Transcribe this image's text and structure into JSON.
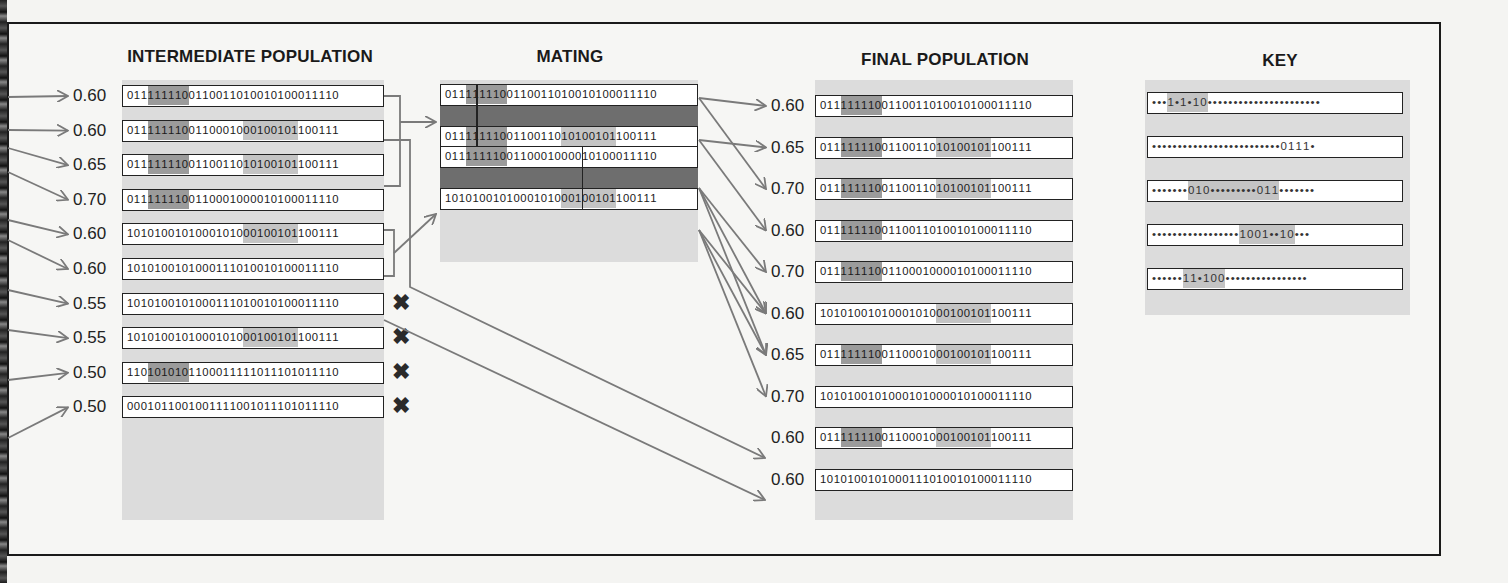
{
  "titles": {
    "intermediate": "INTERMEDIATE POPULATION",
    "mating": "MATING",
    "final": "FINAL POPULATION",
    "key": "KEY"
  },
  "colors": {
    "highlight_dark": "#9b9b9b",
    "highlight_light": "#c4c4c4",
    "arrow": "#7a7a7a",
    "band": "#dcdcdc"
  },
  "intermediate": [
    {
      "fitness": "0.60",
      "bits": "0111111100110011010010100011110",
      "shade": [
        [
          3,
          9,
          "dark"
        ]
      ],
      "culled": false
    },
    {
      "fitness": "0.60",
      "bits": "0111111100110001000100101100111",
      "shade": [
        [
          3,
          9,
          "dark"
        ],
        [
          17,
          25,
          "light"
        ]
      ],
      "culled": false
    },
    {
      "fitness": "0.65",
      "bits": "0111111100110011010100101100111",
      "shade": [
        [
          3,
          9,
          "dark"
        ],
        [
          17,
          25,
          "light"
        ]
      ],
      "culled": false
    },
    {
      "fitness": "0.70",
      "bits": "0111111100110001000010100011110",
      "shade": [
        [
          3,
          9,
          "dark"
        ]
      ],
      "culled": false
    },
    {
      "fitness": "0.60",
      "bits": "1010100101000101000100101100111",
      "shade": [
        [
          17,
          25,
          "light"
        ]
      ],
      "culled": false
    },
    {
      "fitness": "0.60",
      "bits": "1010100101000111010010100011110",
      "shade": [],
      "culled": false
    },
    {
      "fitness": "0.55",
      "bits": "1010100101000111010010100011110",
      "shade": [],
      "culled": true
    },
    {
      "fitness": "0.55",
      "bits": "1010100101000101000100101100111",
      "shade": [
        [
          17,
          25,
          "light"
        ]
      ],
      "culled": true
    },
    {
      "fitness": "0.50",
      "bits": "1101010101100011111011101011110",
      "shade": [
        [
          3,
          9,
          "dark"
        ]
      ],
      "culled": true
    },
    {
      "fitness": "0.50",
      "bits": "0001011001001111001011101011110",
      "shade": [],
      "culled": true
    }
  ],
  "mating": [
    {
      "cut_after": 4,
      "parents": [
        {
          "bits": "0111111100110011010010100011110",
          "shade": [
            [
              3,
              9,
              "dark"
            ]
          ]
        },
        {
          "bits": "0111111100110011010100101100111",
          "shade": [
            [
              3,
              9,
              "dark"
            ],
            [
              17,
              25,
              "light"
            ]
          ]
        }
      ]
    },
    {
      "cut_after": 17,
      "parents": [
        {
          "bits": "0111111100110001000010100011110",
          "shade": [
            [
              3,
              9,
              "dark"
            ]
          ]
        },
        {
          "bits": "1010100101000101000100101100111",
          "shade": [
            [
              17,
              25,
              "light"
            ]
          ]
        }
      ]
    }
  ],
  "final": [
    {
      "fitness": "0.60",
      "bits": "0111111100110011010010100011110",
      "shade": [
        [
          3,
          9,
          "dark"
        ]
      ]
    },
    {
      "fitness": "0.65",
      "bits": "0111111100110011010100101100111",
      "shade": [
        [
          3,
          9,
          "dark"
        ],
        [
          17,
          25,
          "light"
        ]
      ]
    },
    {
      "fitness": "0.70",
      "bits": "0111111100110011010100101100111",
      "shade": [
        [
          3,
          9,
          "dark"
        ],
        [
          17,
          25,
          "light"
        ]
      ]
    },
    {
      "fitness": "0.60",
      "bits": "0111111100110011010010100011110",
      "shade": [
        [
          3,
          9,
          "dark"
        ]
      ]
    },
    {
      "fitness": "0.70",
      "bits": "0111111100110001000010100011110",
      "shade": [
        [
          3,
          9,
          "dark"
        ]
      ]
    },
    {
      "fitness": "0.60",
      "bits": "1010100101000101000100101100111",
      "shade": [
        [
          17,
          25,
          "light"
        ]
      ]
    },
    {
      "fitness": "0.65",
      "bits": "0111111100110001000100101100111",
      "shade": [
        [
          3,
          9,
          "dark"
        ],
        [
          17,
          25,
          "light"
        ]
      ]
    },
    {
      "fitness": "0.70",
      "bits": "1010100101000101000010100011110",
      "shade": []
    },
    {
      "fitness": "0.60",
      "bits": "0111111100110001000100101100111",
      "shade": [
        [
          3,
          9,
          "dark"
        ],
        [
          17,
          25,
          "light"
        ]
      ]
    },
    {
      "fitness": "0.60",
      "bits": "1010100101000111010010100011110",
      "shade": []
    }
  ],
  "key": [
    {
      "pattern": "***1*1*10**********************",
      "shade": [
        [
          3,
          9,
          "light"
        ]
      ]
    },
    {
      "pattern": "*************************0111*",
      "shade": []
    },
    {
      "pattern": "*******010*********011*******",
      "shade": [
        [
          7,
          22,
          "light"
        ]
      ]
    },
    {
      "pattern": "*****************1001**10***",
      "shade": [
        [
          17,
          25,
          "light"
        ]
      ]
    },
    {
      "pattern": "******11*100****************",
      "shade": [
        [
          6,
          12,
          "light"
        ]
      ]
    }
  ],
  "cull_mark": "✖"
}
